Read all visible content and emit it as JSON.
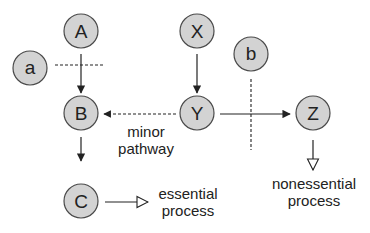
{
  "diagram": {
    "nodes": [
      {
        "id": "A",
        "label": "A",
        "cx": 81,
        "cy": 31
      },
      {
        "id": "a",
        "label": "a",
        "cx": 30,
        "cy": 67
      },
      {
        "id": "B",
        "label": "B",
        "cx": 81,
        "cy": 113
      },
      {
        "id": "C",
        "label": "C",
        "cx": 81,
        "cy": 181
      },
      {
        "id": "X",
        "label": "X",
        "cx": 197,
        "cy": 31
      },
      {
        "id": "b",
        "label": "b",
        "cx": 251,
        "cy": 54
      },
      {
        "id": "Y",
        "label": "Y",
        "cx": 197,
        "cy": 113
      },
      {
        "id": "Z",
        "label": "Z",
        "cx": 313,
        "cy": 113
      }
    ],
    "edges": [
      {
        "from": "A",
        "to": "B",
        "style": "solid",
        "head": "filled"
      },
      {
        "from": "X",
        "to": "Y",
        "style": "solid",
        "head": "filled"
      },
      {
        "from": "B",
        "to": "C",
        "style": "solid",
        "head": "filled"
      },
      {
        "from": "Y",
        "to": "B",
        "style": "dashed",
        "head": "filled",
        "label": "minor pathway"
      },
      {
        "from": "Y",
        "to": "Z",
        "style": "solid",
        "head": "filled"
      },
      {
        "from": "C",
        "to": "essential process",
        "style": "solid",
        "head": "open"
      },
      {
        "from": "Z",
        "to": "nonessential process",
        "style": "solid",
        "head": "open"
      }
    ],
    "inhibitors": [
      {
        "from": "a",
        "blocks": "A→B",
        "style": "dashed"
      },
      {
        "from": "b",
        "blocks": "Y→Z",
        "style": "dashed"
      }
    ],
    "labels": {
      "minor_line1": "minor",
      "minor_line2": "pathway",
      "essential_line1": "essential",
      "essential_line2": "process",
      "nonessential_line1": "nonessential",
      "nonessential_line2": "process"
    },
    "colors": {
      "node_fill": "#d3d3d3",
      "node_stroke": "#4a4a4a",
      "line": "#222222",
      "background": "#ffffff"
    }
  }
}
